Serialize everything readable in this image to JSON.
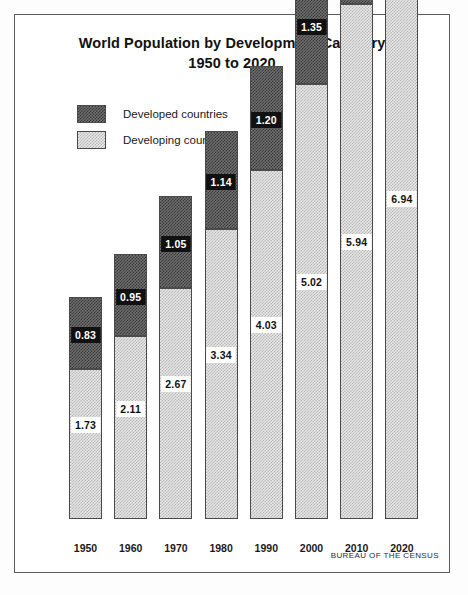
{
  "figure": {
    "title_line1": "World Population by Development Category",
    "title_line2": "1950 to 2020",
    "source": "BUREAU OF THE CENSUS"
  },
  "legend": {
    "items": [
      {
        "label": "Developed countries",
        "swatch": "dark-hatch-swatch"
      },
      {
        "label": "Developing countries",
        "swatch": "light-hatch-swatch"
      }
    ]
  },
  "chart_data": {
    "type": "bar",
    "stacked": true,
    "title": "World Population by Development Category 1950 to 2020",
    "xlabel": "",
    "ylabel": "",
    "grid": false,
    "legend_position": "top-left",
    "units": "billions of people",
    "categories": [
      "1950",
      "1960",
      "1970",
      "1980",
      "1990",
      "2000",
      "2010",
      "2020"
    ],
    "series": [
      {
        "name": "Developing countries",
        "fill": "light-hatch",
        "values": [
          1.73,
          2.11,
          2.67,
          3.34,
          4.03,
          5.02,
          5.94,
          6.94
        ]
      },
      {
        "name": "Developed countries",
        "fill": "dark-hatch",
        "values": [
          0.83,
          0.95,
          1.05,
          1.14,
          1.2,
          1.35,
          1.32,
          1.35
        ]
      }
    ],
    "totals": [
      2.56,
      3.06,
      3.72,
      4.48,
      5.23,
      6.37,
      7.26,
      8.29
    ],
    "ylim": [
      0,
      8.5
    ]
  },
  "colors": {
    "dark_fill": "#5a5a5a",
    "light_fill": "#dcdcdc",
    "outline": "#4a4a4a",
    "text": "#1a1a1a"
  }
}
